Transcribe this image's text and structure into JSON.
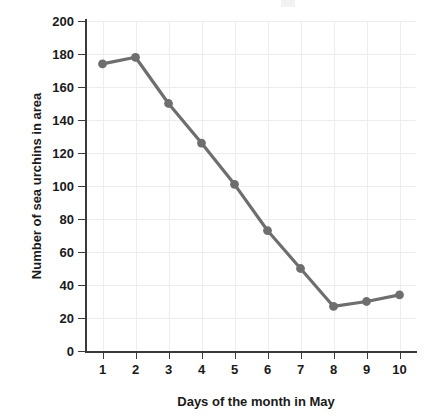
{
  "chart_data": {
    "type": "line",
    "title": "",
    "xlabel": "Days of the month in May",
    "ylabel": "Number of sea urchins in area",
    "x": [
      1,
      2,
      3,
      4,
      5,
      6,
      7,
      8,
      9,
      10
    ],
    "categories": [
      "1",
      "2",
      "3",
      "4",
      "5",
      "6",
      "7",
      "8",
      "9",
      "10"
    ],
    "values": [
      174,
      178,
      150,
      126,
      101,
      73,
      50,
      27,
      30,
      34
    ],
    "series": [
      {
        "name": "Number of sea urchins in area",
        "values": [
          174,
          178,
          150,
          126,
          101,
          73,
          50,
          27,
          30,
          34
        ]
      }
    ],
    "xlim": [
      0.5,
      10.5
    ],
    "ylim": [
      0,
      200
    ],
    "yticks": [
      0,
      20,
      40,
      60,
      80,
      100,
      120,
      140,
      160,
      180,
      200
    ],
    "ytick_labels": [
      "0",
      "20",
      "40",
      "60",
      "80",
      "100",
      "120",
      "140",
      "160",
      "180",
      "200"
    ],
    "xticks": [
      1,
      2,
      3,
      4,
      5,
      6,
      7,
      8,
      9,
      10
    ],
    "xtick_labels": [
      "1",
      "2",
      "3",
      "4",
      "5",
      "6",
      "7",
      "8",
      "9",
      "10"
    ],
    "grid": true,
    "legend": false,
    "legend_position": "none",
    "marker": "circle",
    "colors": {
      "line": "#6e6e6e",
      "marker": "#6e6e6e",
      "grid": "#ededed",
      "axis": "#3a3a3a",
      "text": "#1a1a1a",
      "background": "#ffffff"
    }
  }
}
